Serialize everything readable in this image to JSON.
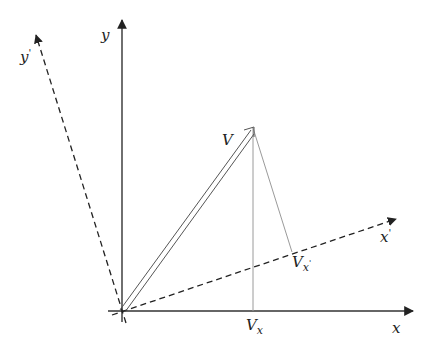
{
  "diagram": {
    "labels": {
      "x_axis": "x",
      "y_axis": "y",
      "x_prime": "x",
      "x_prime_mark": "'",
      "y_prime": "y",
      "y_prime_mark": "'",
      "vector": "V",
      "vx_main": "V",
      "vx_sub": "x",
      "vxp_main": "V",
      "vxp_sub": "x",
      "vxp_mark": "'"
    },
    "geometry": {
      "origin": [
        122,
        311
      ],
      "x_axis_end": [
        415,
        311
      ],
      "y_axis_end": [
        122,
        18
      ],
      "x_prime_end": [
        398,
        218
      ],
      "y_prime_end": [
        35,
        33
      ],
      "vector_tip": [
        253,
        128
      ],
      "projection_x_foot": [
        253,
        311
      ],
      "projection_xprime_foot": [
        292,
        252
      ]
    },
    "colors": {
      "axis": "#333333",
      "dashed": "#222222",
      "vector": "#555555",
      "projection": "#9a9a9a"
    }
  }
}
